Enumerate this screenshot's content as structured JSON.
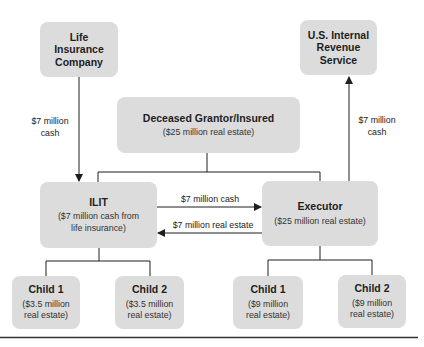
{
  "diagram": {
    "nodes": {
      "life_insurance": {
        "title": "Life Insurance Company"
      },
      "irs": {
        "title": "U.S. Internal Revenue Service"
      },
      "deceased": {
        "title": "Deceased Grantor/Insured",
        "sub": "($25 million real estate)"
      },
      "ilit": {
        "title": "ILIT",
        "sub": "($7 million cash from life insurance)"
      },
      "executor": {
        "title": "Executor",
        "sub": "($25 million real estate)"
      },
      "ilit_child1": {
        "title": "Child 1",
        "sub": "($3.5 million real estate)"
      },
      "ilit_child2": {
        "title": "Child 2",
        "sub": "($3.5 million real estate)"
      },
      "exec_child1": {
        "title": "Child 1",
        "sub": "($9 million real estate)"
      },
      "exec_child2": {
        "title": "Child 2",
        "sub": "($9 million real estate)"
      }
    },
    "edges": {
      "insurance_to_ilit": {
        "label_line1": "$7 million",
        "label_line2": "cash"
      },
      "executor_to_irs": {
        "label_line1": "$7 million",
        "label_line2": "cash"
      },
      "ilit_to_executor": {
        "label": "$7 million cash"
      },
      "executor_to_ilit": {
        "label": "$7 million real estate"
      }
    },
    "colors": {
      "box_fill": "#dcdcdc",
      "line": "#1e1e1e"
    }
  }
}
